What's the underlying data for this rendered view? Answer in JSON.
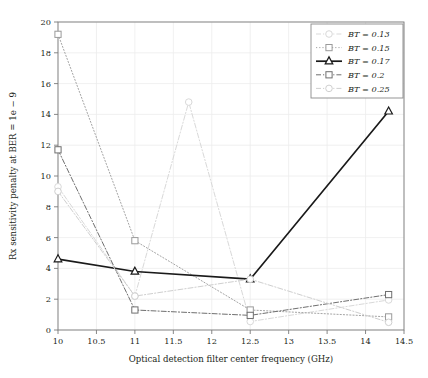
{
  "chart_data": {
    "type": "line",
    "title": "",
    "xlabel": "Optical detection filter center frequency (GHz)",
    "ylabel": "Rx sensitivity penalty at BER = 1e − 9",
    "xlim": [
      10,
      14.5
    ],
    "ylim": [
      0,
      20
    ],
    "xticks": [
      "10",
      "10.5",
      "11",
      "11.5",
      "12",
      "12.5",
      "13",
      "13.5",
      "14",
      "14.5"
    ],
    "xtick_values": [
      10,
      10.5,
      11,
      11.5,
      12,
      12.5,
      13,
      13.5,
      14,
      14.5
    ],
    "yticks": [
      "0",
      "2",
      "4",
      "6",
      "8",
      "10",
      "12",
      "14",
      "16",
      "18",
      "20"
    ],
    "ytick_values": [
      0,
      2,
      4,
      6,
      8,
      10,
      12,
      14,
      16,
      18,
      20
    ],
    "grid": true,
    "legend_position": "top-right",
    "series": [
      {
        "name": "BT = 0.13",
        "legend_label": "BT = 0.13",
        "marker": "circle",
        "color": "#d9d9d9",
        "linestyle": "dashdot",
        "linewidth": 1.0,
        "x": [
          10,
          11,
          11.7,
          12.5,
          14.3
        ],
        "y": [
          9.3,
          2.2,
          14.8,
          0.55,
          1.95
        ]
      },
      {
        "name": "BT = 0.15",
        "legend_label": "BT = 0.15",
        "marker": "square",
        "color": "#9a9a9a",
        "linestyle": "dotted",
        "linewidth": 0.9,
        "x": [
          10,
          11,
          12.5,
          14.3
        ],
        "y": [
          19.2,
          5.8,
          1.3,
          0.85
        ]
      },
      {
        "name": "BT = 0.17",
        "legend_label": "BT = 0.17",
        "marker": "triangle",
        "color": "#1a1a1a",
        "linestyle": "solid",
        "linewidth": 1.7,
        "x": [
          10,
          11,
          12.5,
          14.3
        ],
        "y": [
          4.6,
          3.8,
          3.3,
          14.2
        ]
      },
      {
        "name": "BT = 0.2",
        "legend_label": "BT = 0.2",
        "marker": "square",
        "color": "#6f6f6f",
        "linestyle": "dashdot",
        "linewidth": 1.0,
        "x": [
          10,
          11,
          12.5,
          14.3
        ],
        "y": [
          11.7,
          1.3,
          0.95,
          2.3
        ]
      },
      {
        "name": "BT = 0.25",
        "legend_label": "BT = 0.25",
        "marker": "circle",
        "color": "#cfcfcf",
        "linestyle": "dashdot",
        "linewidth": 1.0,
        "x": [
          10,
          11,
          12.5,
          14.3
        ],
        "y": [
          9.0,
          2.2,
          3.3,
          0.5
        ]
      }
    ]
  },
  "axes": {
    "x_label": "Optical detection filter center frequency (GHz)",
    "y_label": "Rx sensitivity penalty at BER = 1e − 9"
  },
  "legend": {
    "items": [
      {
        "label": "BT = 0.13"
      },
      {
        "label": "BT = 0.15"
      },
      {
        "label": "BT = 0.17"
      },
      {
        "label": "BT = 0.2"
      },
      {
        "label": "BT = 0.25"
      }
    ]
  },
  "colors": {
    "frame": "#7a7a7a",
    "grid": "#ececec",
    "text": "#231f20",
    "background": "#ffffff"
  }
}
